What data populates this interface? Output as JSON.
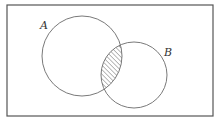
{
  "diagram": {
    "type": "venn",
    "universe_frame": {
      "x": 7,
      "y": 5,
      "width": 206,
      "height": 111,
      "stroke": "#555555"
    },
    "sets": [
      {
        "label": "A",
        "cx": 82,
        "cy": 56,
        "r": 40,
        "label_x": 40,
        "label_y": 29
      },
      {
        "label": "B",
        "cx": 134,
        "cy": 75,
        "r": 33,
        "label_x": 164,
        "label_y": 56
      }
    ],
    "shaded_region": "A ∩ B",
    "shading_style": "diagonal-hatch",
    "shading_color": "#555555"
  }
}
